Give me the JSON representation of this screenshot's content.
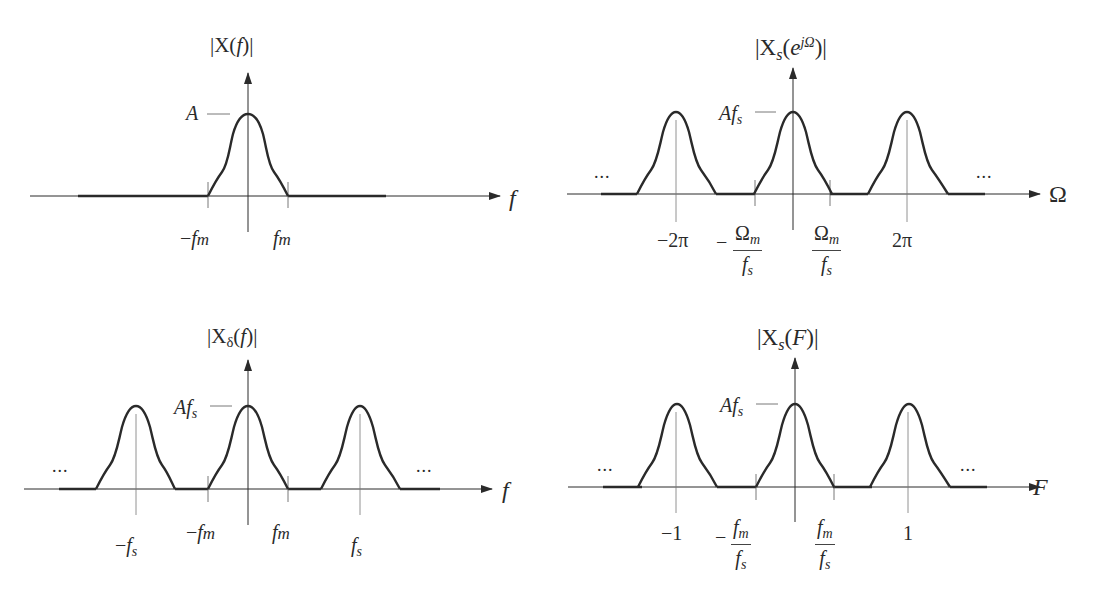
{
  "figure": {
    "stroke_color": "#2a2a2a",
    "background": "#ffffff"
  },
  "panels": [
    {
      "id": "top-left",
      "title_prefix": "|X(",
      "title_var": "f",
      "title_suffix": ")|",
      "x_axis_label": "f",
      "peak_label": "A",
      "ticks": [
        "−f",
        "m",
        "f",
        "m"
      ],
      "tick_labels": [
        "−fm",
        "fm"
      ]
    },
    {
      "id": "top-right",
      "title_prefix": "|X",
      "title_sub": "s",
      "title_mid": "(",
      "title_var": "e",
      "title_sup": "jΩ",
      "title_suffix": ")|",
      "x_axis_label": "Ω",
      "peak_label_main": "Af",
      "peak_label_sub": "s",
      "ellipsis_left": "...",
      "ellipsis_right": "...",
      "tick_labels": [
        "−2π",
        "−Ωm/fs",
        "Ωm/fs",
        "2π"
      ],
      "tick_neg2pi": "−2π",
      "tick_2pi": "2π",
      "frac_minus": "−",
      "frac_num": "Ω",
      "frac_num_sub": "m",
      "frac_den": "f",
      "frac_den_sub": "s"
    },
    {
      "id": "bottom-left",
      "title_prefix": "|X",
      "title_sub": "δ",
      "title_mid": "(",
      "title_var": "f",
      "title_suffix": ")|",
      "x_axis_label": "f",
      "peak_label_main": "Af",
      "peak_label_sub": "s",
      "ellipsis_left": "...",
      "ellipsis_right": "...",
      "tick_labels": [
        "−fs",
        "−fm",
        "fm",
        "fs"
      ]
    },
    {
      "id": "bottom-right",
      "title_prefix": "|X",
      "title_sub": "s",
      "title_mid": "(",
      "title_var": "F",
      "title_suffix": ")|",
      "x_axis_label": "F",
      "peak_label_main": "Af",
      "peak_label_sub": "s",
      "ellipsis_left": "...",
      "ellipsis_right": "...",
      "tick_labels": [
        "−1",
        "−fm/fs",
        "fm/fs",
        "1"
      ],
      "tick_neg1": "−1",
      "tick_1": "1",
      "frac_minus": "−",
      "frac_num": "f",
      "frac_num_sub": "m",
      "frac_den": "f",
      "frac_den_sub": "s"
    }
  ],
  "text": {
    "minus": "−",
    "f": "f",
    "m": "m",
    "s": "s",
    "A": "A"
  }
}
